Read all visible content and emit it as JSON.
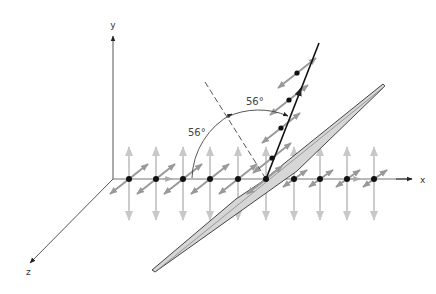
{
  "diagram": {
    "axes": {
      "x_label": "x",
      "y_label": "y",
      "z_label": "z"
    },
    "angles": {
      "incidence_label": "56°",
      "reflection_label": "56°"
    },
    "colors": {
      "axis": "#555555",
      "ray": "#111111",
      "dot": "#111111",
      "vertical_vector": "#cccccc",
      "diagonal_vector": "#999999",
      "plate_fill": "#d6d6d6",
      "plate_stroke": "#444444",
      "normal_dashed": "#555555"
    },
    "incident_dots_x": [
      129,
      156,
      183,
      210,
      238,
      266
    ],
    "transmitted_dots_x": [
      294,
      320,
      347,
      374
    ],
    "reflected_dots": [
      [
        272,
        158
      ],
      [
        281,
        128
      ],
      [
        289,
        100
      ],
      [
        297,
        73
      ]
    ]
  }
}
